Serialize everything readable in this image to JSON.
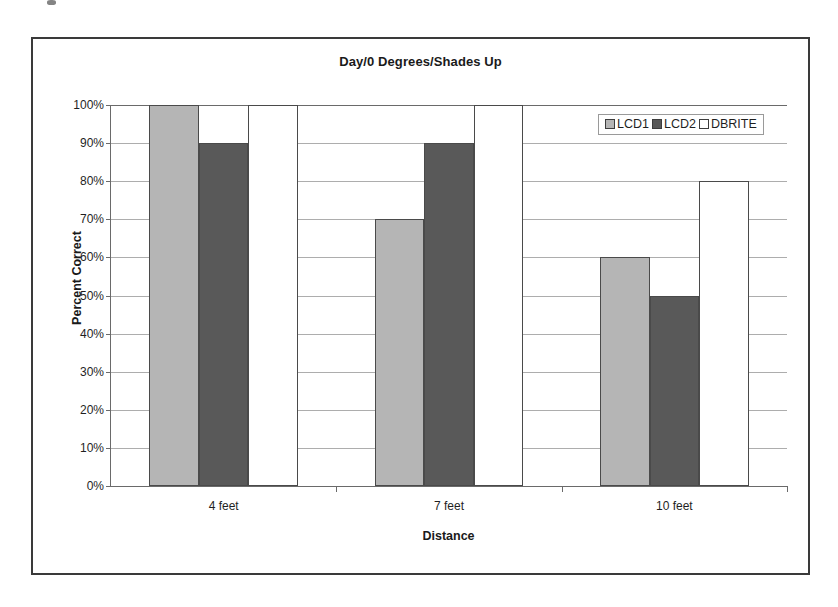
{
  "chart_data": {
    "type": "bar",
    "title": "Day/0 Degrees/Shades Up",
    "xlabel": "Distance",
    "ylabel": "Percent Correct",
    "categories": [
      "4 feet",
      "7 feet",
      "10 feet"
    ],
    "series": [
      {
        "name": "LCD1",
        "color": "#b5b5b5",
        "values": [
          100,
          70,
          60
        ]
      },
      {
        "name": "LCD2",
        "color": "#595959",
        "values": [
          90,
          90,
          50
        ]
      },
      {
        "name": "DBRITE",
        "color": "#ffffff",
        "values": [
          100,
          100,
          80
        ]
      }
    ],
    "ylim": [
      0,
      100
    ],
    "ytick_labels": [
      "100%",
      "90%",
      "80%",
      "70%",
      "60%",
      "50%",
      "40%",
      "30%",
      "20%",
      "10%",
      "0%"
    ],
    "ytick_values": [
      100,
      90,
      80,
      70,
      60,
      50,
      40,
      30,
      20,
      10,
      0
    ],
    "grid": true,
    "legend_position": "top-right",
    "value_suffix": "%"
  }
}
